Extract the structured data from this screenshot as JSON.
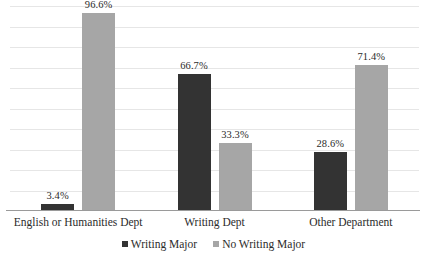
{
  "chart_data": {
    "type": "bar",
    "title": "",
    "subtitle": "",
    "xlabel": "",
    "ylabel": "",
    "ylim": [
      0,
      100
    ],
    "grid": true,
    "gridline_count": 10,
    "legend_position": "bottom-center",
    "categories": [
      "English or Humanities Dept",
      "Writing Dept",
      "Other Department"
    ],
    "series": [
      {
        "name": "Writing Major",
        "color": "#333333",
        "values": [
          3.4,
          66.7,
          28.6
        ],
        "labels": [
          "3.4%",
          "66.7%",
          "28.6%"
        ]
      },
      {
        "name": "No Writing Major",
        "color": "#a6a6a6",
        "values": [
          96.6,
          33.3,
          71.4
        ],
        "labels": [
          "96.6%",
          "33.3%",
          "71.4%"
        ]
      }
    ]
  },
  "legend": {
    "entries": [
      {
        "label": "Writing Major",
        "swatch": "legend-swatch-dark"
      },
      {
        "label": "No Writing Major",
        "swatch": "legend-swatch-light"
      }
    ]
  },
  "colors": {
    "series_writing_major": "#333333",
    "series_no_writing_major": "#a6a6a6",
    "gridline": "#e6e6e6",
    "axis": "#9a9a9a",
    "text": "#2b2b2b",
    "background": "#ffffff"
  }
}
